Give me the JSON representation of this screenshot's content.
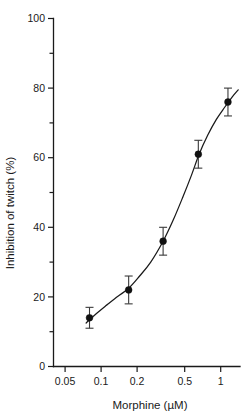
{
  "chart_data": {
    "type": "scatter",
    "title": "",
    "xlabel": "Morphine (µM)",
    "ylabel": "Inhibition of twitch  (%)",
    "xscale": "log",
    "yscale": "linear",
    "xlim": [
      0.04,
      1.45
    ],
    "ylim": [
      0,
      100
    ],
    "grid": false,
    "legend": null,
    "x_tick_labels": [
      "0.05",
      "0.1",
      "0.2",
      "0.5",
      "1"
    ],
    "x_tick_values": [
      0.05,
      0.1,
      0.2,
      0.5,
      1
    ],
    "y_tick_labels": [
      "0",
      "20",
      "40",
      "60",
      "80",
      "100"
    ],
    "y_tick_values": [
      0,
      20,
      40,
      60,
      80,
      100
    ],
    "y_minor_ticks": [
      10,
      30,
      50,
      70,
      90
    ],
    "series": [
      {
        "name": "Inhibition of twitch",
        "marker": "filled-circle",
        "color": "#111111",
        "points": [
          {
            "x": 0.08,
            "y": 14,
            "err": 3
          },
          {
            "x": 0.17,
            "y": 22,
            "err": 4
          },
          {
            "x": 0.33,
            "y": 36,
            "err": 4
          },
          {
            "x": 0.65,
            "y": 61,
            "err": 4
          },
          {
            "x": 1.15,
            "y": 76,
            "err": 4
          }
        ]
      }
    ],
    "fit_curve": {
      "name": "sigmoid fit",
      "color": "#1a1a1a",
      "points": [
        {
          "x": 0.075,
          "y": 12.5
        },
        {
          "x": 0.09,
          "y": 15.0
        },
        {
          "x": 0.11,
          "y": 17.5
        },
        {
          "x": 0.13,
          "y": 19.5
        },
        {
          "x": 0.17,
          "y": 22.5
        },
        {
          "x": 0.21,
          "y": 26.0
        },
        {
          "x": 0.26,
          "y": 30.0
        },
        {
          "x": 0.33,
          "y": 36.0
        },
        {
          "x": 0.4,
          "y": 42.0
        },
        {
          "x": 0.48,
          "y": 48.5
        },
        {
          "x": 0.57,
          "y": 55.0
        },
        {
          "x": 0.66,
          "y": 61.0
        },
        {
          "x": 0.78,
          "y": 66.5
        },
        {
          "x": 0.92,
          "y": 71.0
        },
        {
          "x": 1.08,
          "y": 74.5
        },
        {
          "x": 1.25,
          "y": 77.5
        },
        {
          "x": 1.4,
          "y": 79.5
        }
      ]
    }
  }
}
